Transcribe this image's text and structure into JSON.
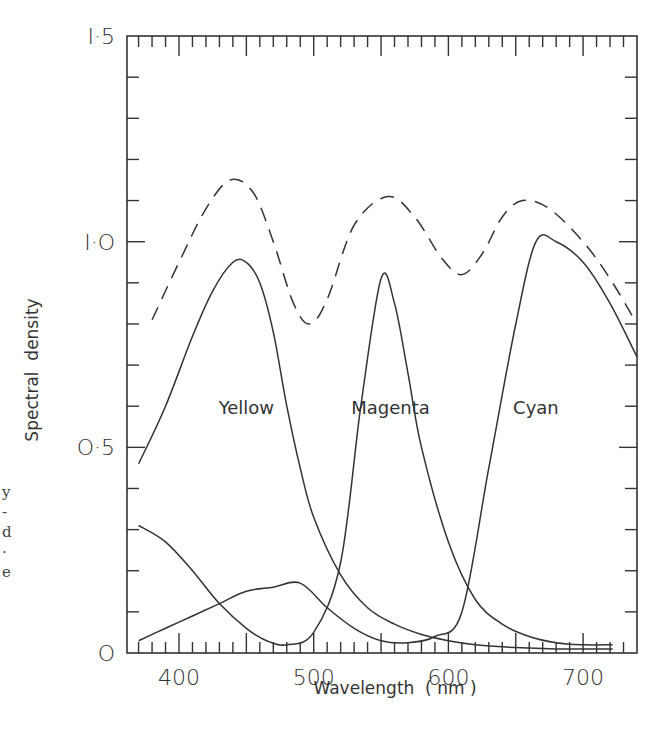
{
  "chart_data": {
    "type": "line",
    "title": "",
    "xlabel": "Wavelength  ( nm )",
    "ylabel": "Spectral  density",
    "xlim": [
      361,
      740
    ],
    "ylim": [
      0,
      1.5
    ],
    "x_ticks": [
      400,
      500,
      600,
      700
    ],
    "x_tick_labels": [
      "400",
      "500",
      "600",
      "700"
    ],
    "y_ticks": [
      0,
      0.5,
      1.0,
      1.5
    ],
    "y_tick_labels": [
      "O",
      "O·5",
      "I·O",
      "I·5"
    ],
    "grid": false,
    "legend": "inline curve labels",
    "series": [
      {
        "name": "Yellow",
        "style": "solid",
        "x": [
          370,
          390,
          410,
          425,
          440,
          450,
          460,
          470,
          480,
          490,
          500,
          520,
          540,
          560,
          580,
          600,
          620,
          640,
          660,
          680,
          700,
          722
        ],
        "values": [
          0.46,
          0.6,
          0.77,
          0.88,
          0.95,
          0.95,
          0.9,
          0.78,
          0.6,
          0.45,
          0.33,
          0.19,
          0.11,
          0.07,
          0.045,
          0.03,
          0.02,
          0.015,
          0.012,
          0.01,
          0.01,
          0.01
        ]
      },
      {
        "name": "Magenta",
        "style": "solid",
        "x": [
          370,
          390,
          410,
          430,
          450,
          465,
          480,
          500,
          520,
          535,
          550,
          560,
          570,
          580,
          600,
          620,
          640,
          660,
          680,
          700,
          722
        ],
        "values": [
          0.31,
          0.27,
          0.2,
          0.12,
          0.06,
          0.03,
          0.02,
          0.05,
          0.22,
          0.6,
          0.91,
          0.85,
          0.68,
          0.5,
          0.27,
          0.13,
          0.07,
          0.04,
          0.025,
          0.02,
          0.02
        ]
      },
      {
        "name": "Cyan",
        "style": "solid",
        "x": [
          370,
          390,
          410,
          430,
          450,
          470,
          490,
          510,
          530,
          550,
          570,
          590,
          610,
          630,
          650,
          665,
          680,
          700,
          720,
          740
        ],
        "values": [
          0.03,
          0.06,
          0.09,
          0.12,
          0.15,
          0.16,
          0.17,
          0.11,
          0.06,
          0.03,
          0.025,
          0.04,
          0.1,
          0.45,
          0.8,
          1.0,
          1.0,
          0.95,
          0.85,
          0.72
        ]
      },
      {
        "name": "Total (sum)",
        "style": "dashed",
        "x": [
          380,
          400,
          420,
          438,
          455,
          470,
          485,
          497,
          510,
          530,
          555,
          575,
          595,
          610,
          625,
          640,
          655,
          675,
          700,
          720,
          740
        ],
        "values": [
          0.81,
          0.95,
          1.08,
          1.15,
          1.12,
          1.0,
          0.85,
          0.8,
          0.86,
          1.04,
          1.11,
          1.06,
          0.96,
          0.92,
          0.97,
          1.06,
          1.1,
          1.08,
          1.0,
          0.91,
          0.8
        ]
      }
    ],
    "annotations": [
      {
        "text": "Yellow",
        "x": 450,
        "y": 0.6
      },
      {
        "text": "Magenta",
        "x": 557,
        "y": 0.6
      },
      {
        "text": "Cyan",
        "x": 665,
        "y": 0.6
      }
    ]
  },
  "margin_fragments": [
    "y",
    "-",
    "d",
    "·",
    "e"
  ]
}
